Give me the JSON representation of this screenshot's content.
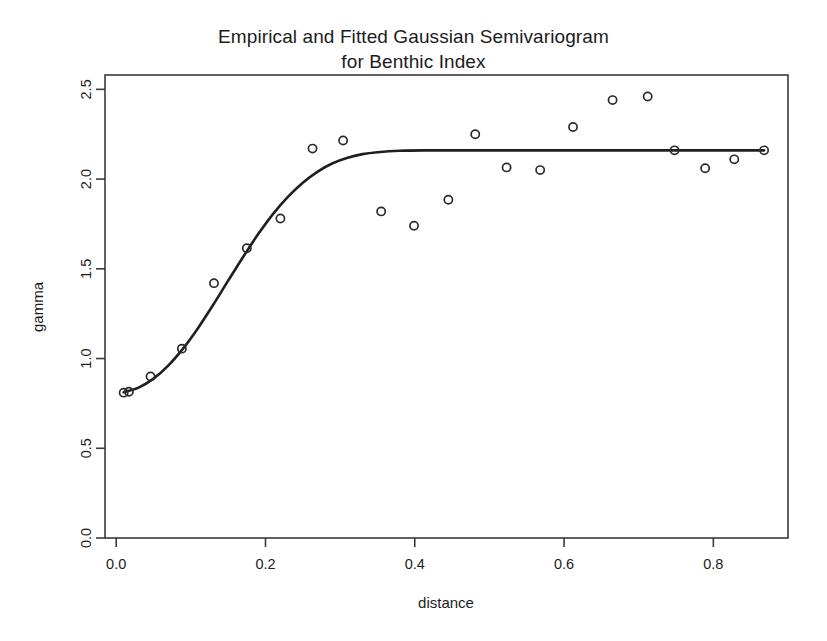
{
  "chart_data": {
    "type": "scatter",
    "title_line1": "Empirical and Fitted Gaussian Semivariogram",
    "title_line2": "for Benthic Index",
    "xlabel": "distance",
    "ylabel": "gamma",
    "xlim": [
      -0.015,
      0.9
    ],
    "ylim": [
      0.0,
      2.58
    ],
    "grid": false,
    "legend": false,
    "legend_position": "none",
    "xticks": [
      0.0,
      0.2,
      0.4,
      0.6,
      0.8
    ],
    "xtick_labels": [
      "0.0",
      "0.2",
      "0.4",
      "0.6",
      "0.8"
    ],
    "yticks": [
      0.0,
      0.5,
      1.0,
      1.5,
      2.0,
      2.5
    ],
    "ytick_labels": [
      "0.0",
      "0.5",
      "1.0",
      "1.5",
      "2.0",
      "2.5"
    ],
    "series": [
      {
        "name": "Empirical semivariogram",
        "marker": "open-circle",
        "color": "#2b2b2b",
        "x": [
          0.01,
          0.017,
          0.046,
          0.088,
          0.131,
          0.175,
          0.22,
          0.263,
          0.304,
          0.355,
          0.399,
          0.445,
          0.481,
          0.523,
          0.568,
          0.612,
          0.665,
          0.712,
          0.748,
          0.789,
          0.828,
          0.868
        ],
        "y": [
          0.81,
          0.815,
          0.9,
          1.055,
          1.42,
          1.615,
          1.78,
          2.17,
          2.215,
          1.82,
          1.74,
          1.885,
          2.25,
          2.065,
          2.05,
          2.29,
          2.44,
          2.46,
          2.16,
          2.06,
          2.11,
          2.16
        ]
      },
      {
        "name": "Fitted Gaussian model",
        "marker": "line",
        "color": "#1f1f1f",
        "x": [
          0.01,
          0.03,
          0.05,
          0.07,
          0.09,
          0.11,
          0.13,
          0.15,
          0.17,
          0.19,
          0.21,
          0.23,
          0.25,
          0.27,
          0.29,
          0.31,
          0.33,
          0.35,
          0.38,
          0.42,
          0.47,
          0.53,
          0.6,
          0.68,
          0.76,
          0.868
        ],
        "y": [
          0.812,
          0.838,
          0.888,
          0.962,
          1.058,
          1.172,
          1.3,
          1.434,
          1.566,
          1.692,
          1.805,
          1.901,
          1.98,
          2.042,
          2.088,
          2.119,
          2.139,
          2.15,
          2.158,
          2.16,
          2.16,
          2.16,
          2.16,
          2.16,
          2.16,
          2.16
        ]
      }
    ],
    "model": {
      "nugget": 0.81,
      "sill": 2.16,
      "range": 0.35
    }
  }
}
